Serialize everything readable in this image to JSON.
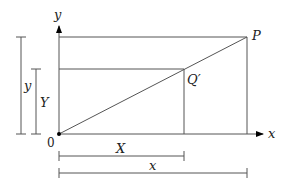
{
  "diagram": {
    "axes": {
      "x_label": "x",
      "y_label": "y",
      "origin_label": "0"
    },
    "points": {
      "P": "P",
      "Q": "Q′"
    },
    "dimensions": {
      "outer_height": "y",
      "inner_height": "Y",
      "inner_width": "X",
      "outer_width": "x"
    }
  }
}
